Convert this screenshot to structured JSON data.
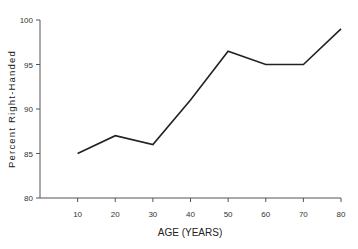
{
  "chart_data": {
    "type": "line",
    "title": "",
    "xlabel": "AGE (YEARS)",
    "ylabel": "Percent Right-Handed",
    "x": [
      10,
      20,
      30,
      40,
      50,
      60,
      70,
      80
    ],
    "series": [
      {
        "name": "Percent Right-Handed",
        "values": [
          85,
          87,
          86,
          91,
          96.5,
          95,
          95,
          99
        ]
      }
    ],
    "xticks": [
      "10",
      "20",
      "30",
      "40",
      "50",
      "60",
      "70",
      "80"
    ],
    "yticks": [
      "80",
      "85",
      "90",
      "95",
      "100"
    ],
    "ylim": [
      80,
      100
    ],
    "xlim": [
      0,
      80
    ],
    "grid": false,
    "legend": null
  }
}
